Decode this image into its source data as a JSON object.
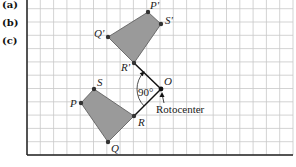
{
  "side_labels": [
    "(a)",
    "(b)",
    "(c)"
  ],
  "grid": {
    "left": 27,
    "top": 0,
    "right": 293,
    "bottom": 155,
    "spacing": 13.3,
    "line_color": "#c8c8c8",
    "border_color": "#222222"
  },
  "colors": {
    "fill": "#9a9a9a",
    "stroke": "#555555",
    "point": "#333333",
    "ray": "#111111"
  },
  "preimage": {
    "name": "PQRS",
    "points": {
      "P": [
        81,
        103
      ],
      "Q": [
        108,
        142
      ],
      "R": [
        134,
        116
      ],
      "S": [
        94,
        89
      ]
    },
    "labels": {
      "P": "P",
      "Q": "Q",
      "R": "R",
      "S": "S"
    }
  },
  "image": {
    "name": "P'Q'R'S'",
    "points": {
      "P": [
        148,
        12
      ],
      "Q": [
        108,
        37
      ],
      "R": [
        134,
        63
      ],
      "S": [
        161,
        24
      ]
    },
    "labels": {
      "P": "P'",
      "Q": "Q'",
      "R": "R'",
      "S": "S'"
    }
  },
  "center": {
    "label": "O",
    "point": [
      161,
      89
    ],
    "caption": "Rotocenter"
  },
  "angle": {
    "label": "90°"
  }
}
